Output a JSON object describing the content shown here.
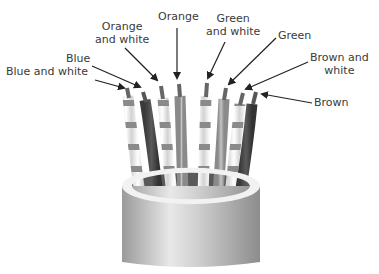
{
  "diagram": {
    "labels": [
      {
        "id": "blue-white",
        "text_lines": [
          "Blue and white"
        ]
      },
      {
        "id": "blue",
        "text_lines": [
          "Blue"
        ]
      },
      {
        "id": "orange-white",
        "text_lines": [
          "Orange",
          "and white"
        ]
      },
      {
        "id": "orange",
        "text_lines": [
          "Orange"
        ]
      },
      {
        "id": "green-white",
        "text_lines": [
          "Green",
          "and white"
        ]
      },
      {
        "id": "green",
        "text_lines": [
          "Green"
        ]
      },
      {
        "id": "brown-white",
        "text_lines": [
          "Brown and",
          "white"
        ]
      },
      {
        "id": "brown",
        "text_lines": [
          "Brown"
        ]
      }
    ],
    "colors": {
      "text": "#3a3a3a",
      "arrow": "#222222",
      "dark_wire": "#4a4a4a",
      "mid_wire": "#a8a8a8",
      "stripe": "#8a8a8a",
      "white_wire": "#f4f4f4",
      "jacket": "#c8c8c8"
    }
  }
}
